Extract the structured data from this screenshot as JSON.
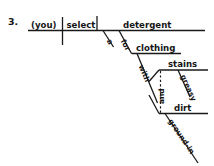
{
  "exercise": {
    "number": "3."
  },
  "diagram": {
    "type": "reed-kellogg-sentence-diagram",
    "ink_color": "#1a1a1a",
    "background_color": "#ffffff",
    "main_clause": {
      "subject": "(you)",
      "verb": "select",
      "direct_object": "detergent"
    },
    "modifiers": {
      "article_a": "a",
      "preposition_for": "for",
      "object_of_for": "clothing",
      "preposition_with": "with",
      "object_of_with": "stains",
      "adjective_greasy": "greasy",
      "conjunction_and": "and",
      "second_object": "dirt",
      "adjective_ground_in": "ground-in"
    }
  }
}
